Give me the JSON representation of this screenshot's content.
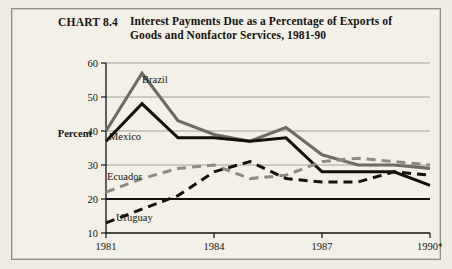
{
  "figure": {
    "number_label": "CHART 8.4",
    "title": "Interest Payments Due as a Percentage of Exports of Goods and Nonfactor Services, 1981-90",
    "background_color": "#f3f1e7",
    "border_color": "#8d8c85"
  },
  "chart_data": {
    "type": "line",
    "title": "Interest Payments Due as a Percentage of Exports of Goods and Nonfactor Services, 1981-90",
    "xlabel": "",
    "ylabel": "Percent",
    "x": [
      1981,
      1982,
      1983,
      1984,
      1985,
      1986,
      1987,
      1988,
      1989,
      1990
    ],
    "xlim": [
      1981,
      1990
    ],
    "ylim": [
      10,
      60
    ],
    "ytick_values": [
      10,
      20,
      30,
      40,
      50,
      60
    ],
    "ytick_labels": [
      "10",
      "20",
      "30",
      "40",
      "50",
      "60"
    ],
    "xtick_values": [
      1981,
      1984,
      1987,
      1990
    ],
    "xtick_labels": [
      "1981",
      "1984",
      "1987",
      "1990*"
    ],
    "grid": "horizontal",
    "legend_position": "inline-labels",
    "reference_line": {
      "value": 20,
      "color": "#14110d",
      "style": "solid"
    },
    "series": [
      {
        "name": "Brazil",
        "color": "#6e6c62",
        "style": "solid",
        "values": [
          40,
          57,
          43,
          39,
          37,
          41,
          33,
          30,
          30,
          29
        ]
      },
      {
        "name": "Mexico",
        "color": "#14110d",
        "style": "solid",
        "values": [
          37,
          48,
          38,
          38,
          37,
          38,
          28,
          28,
          28,
          24
        ]
      },
      {
        "name": "Ecuador",
        "color": "#8d8b80",
        "style": "dashed",
        "values": [
          22,
          26,
          29,
          30,
          26,
          27,
          31,
          32,
          31,
          30
        ]
      },
      {
        "name": "Uruguay",
        "color": "#14110d",
        "style": "dashed",
        "values": [
          13,
          17,
          21,
          28,
          31,
          26,
          25,
          25,
          28,
          27
        ]
      }
    ]
  }
}
